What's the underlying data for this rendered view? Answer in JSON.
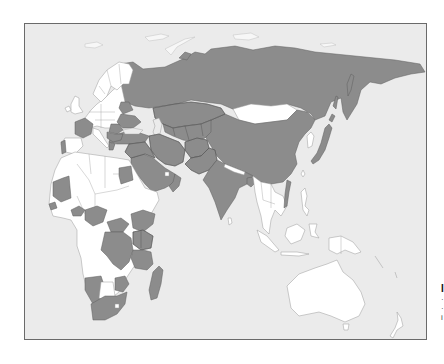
{
  "map": {
    "type": "choropleth",
    "region_shown": "Europe, Africa, Asia, Oceania",
    "legend": {
      "highlighted_color": "#8c8c8c",
      "not_highlighted_color": "#ffffff",
      "background_color": "#ebebeb",
      "border_color": "#6a6a6a"
    },
    "highlighted_countries": [
      "Russia",
      "China",
      "Kazakhstan",
      "Uzbekistan",
      "Turkmenistan",
      "Kyrgyzstan",
      "Tajikistan",
      "Afghanistan",
      "Pakistan",
      "India",
      "Iran",
      "Iraq",
      "Saudi Arabia",
      "Oman",
      "Yemen",
      "Turkey",
      "Syria",
      "Jordan",
      "Japan",
      "Ukraine",
      "Belarus",
      "France",
      "Portugal",
      "Romania",
      "Serbia",
      "Greece",
      "Bulgaria",
      "Egypt",
      "Mauritania",
      "Senegal",
      "Burkina Faso",
      "Nigeria",
      "Ethiopia",
      "Democratic Republic of the Congo",
      "Central African Republic",
      "Uganda",
      "Kenya",
      "Tanzania",
      "Namibia",
      "South Africa",
      "Zimbabwe",
      "Mozambique",
      "Madagascar",
      "Bangladesh",
      "Vietnam"
    ],
    "non_highlighted_examples": [
      "Mongolia",
      "Australia",
      "New Zealand",
      "Indonesia",
      "Papua New Guinea",
      "Thailand",
      "Myanmar",
      "Nepal",
      "Algeria",
      "Libya",
      "Sudan",
      "Angola",
      "Botswana",
      "Germany",
      "Spain",
      "Poland",
      "Sweden",
      "Norway",
      "Finland",
      "United Kingdom",
      "Italy"
    ]
  },
  "edge_text": {
    "line_0": "I",
    "line_1": "·",
    "line_2": "·",
    "line_3": "i"
  }
}
